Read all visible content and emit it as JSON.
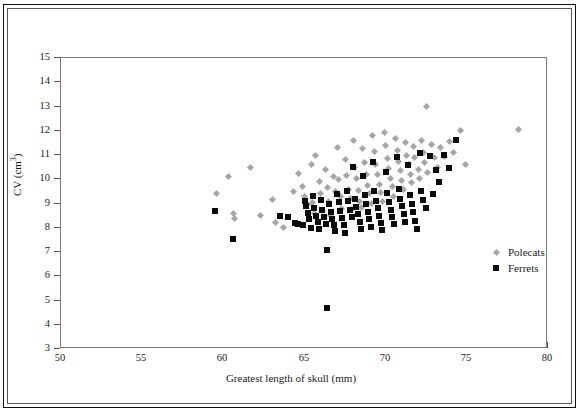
{
  "chart_data": {
    "type": "scatter",
    "title": "",
    "xlabel": "Greatest length of skull (mm)",
    "ylabel": "CV (cm³)",
    "ylabel_base": "CV (cm",
    "ylabel_sup": "3",
    "ylabel_tail": ")",
    "xlim": [
      50,
      80
    ],
    "ylim": [
      3,
      15
    ],
    "xticks": [
      50,
      55,
      60,
      65,
      70,
      75,
      80
    ],
    "yticks": [
      3,
      4,
      5,
      6,
      7,
      8,
      9,
      10,
      11,
      12,
      13,
      14,
      15
    ],
    "grid": false,
    "legend_position": "inside-right",
    "legend": [
      {
        "name": "Polecats",
        "marker": "diamond",
        "color": "#a6a6a6"
      },
      {
        "name": "Ferrets",
        "marker": "square",
        "color": "#0b0b0b"
      }
    ],
    "series": [
      {
        "name": "Polecats",
        "marker": "diamond",
        "color": "#a6a6a6",
        "points": [
          [
            59.6,
            9.4
          ],
          [
            60.3,
            10.1
          ],
          [
            60.6,
            8.6
          ],
          [
            60.7,
            8.4
          ],
          [
            61.7,
            10.5
          ],
          [
            62.3,
            8.5
          ],
          [
            63.0,
            9.15
          ],
          [
            63.2,
            8.2
          ],
          [
            63.7,
            8.0
          ],
          [
            64.3,
            9.5
          ],
          [
            64.6,
            10.25
          ],
          [
            64.9,
            9.7
          ],
          [
            65.0,
            9.3
          ],
          [
            65.2,
            8.95
          ],
          [
            65.4,
            10.6
          ],
          [
            65.5,
            9.05
          ],
          [
            65.6,
            8.6
          ],
          [
            65.7,
            11.0
          ],
          [
            65.9,
            9.9
          ],
          [
            66.0,
            9.4
          ],
          [
            66.1,
            8.7
          ],
          [
            66.3,
            10.4
          ],
          [
            66.4,
            9.65
          ],
          [
            66.5,
            9.1
          ],
          [
            66.6,
            8.5
          ],
          [
            66.8,
            10.1
          ],
          [
            66.9,
            9.5
          ],
          [
            67.0,
            11.3
          ],
          [
            67.1,
            10.0
          ],
          [
            67.2,
            9.3
          ],
          [
            67.3,
            8.8
          ],
          [
            67.5,
            10.8
          ],
          [
            67.6,
            10.15
          ],
          [
            67.7,
            9.6
          ],
          [
            67.8,
            9.2
          ],
          [
            67.9,
            8.75
          ],
          [
            68.0,
            11.6
          ],
          [
            68.1,
            10.5
          ],
          [
            68.2,
            10.05
          ],
          [
            68.3,
            9.55
          ],
          [
            68.4,
            9.1
          ],
          [
            68.5,
            8.85
          ],
          [
            68.6,
            11.25
          ],
          [
            68.7,
            10.7
          ],
          [
            68.8,
            10.2
          ],
          [
            68.9,
            9.75
          ],
          [
            69.0,
            9.4
          ],
          [
            69.1,
            9.0
          ],
          [
            69.2,
            11.8
          ],
          [
            69.3,
            11.15
          ],
          [
            69.4,
            10.6
          ],
          [
            69.5,
            10.2
          ],
          [
            69.6,
            9.8
          ],
          [
            69.7,
            9.45
          ],
          [
            69.8,
            9.1
          ],
          [
            69.9,
            11.95
          ],
          [
            70.0,
            11.4
          ],
          [
            70.1,
            10.85
          ],
          [
            70.2,
            10.45
          ],
          [
            70.3,
            10.05
          ],
          [
            70.4,
            9.7
          ],
          [
            70.5,
            9.3
          ],
          [
            70.6,
            11.7
          ],
          [
            70.7,
            11.2
          ],
          [
            70.8,
            10.75
          ],
          [
            70.9,
            10.35
          ],
          [
            71.0,
            9.95
          ],
          [
            71.1,
            9.6
          ],
          [
            71.2,
            11.5
          ],
          [
            71.3,
            11.0
          ],
          [
            71.4,
            10.6
          ],
          [
            71.5,
            10.2
          ],
          [
            71.6,
            9.85
          ],
          [
            71.7,
            11.35
          ],
          [
            71.8,
            10.9
          ],
          [
            72.0,
            10.4
          ],
          [
            72.1,
            10.05
          ],
          [
            72.2,
            11.6
          ],
          [
            72.3,
            11.1
          ],
          [
            72.4,
            10.7
          ],
          [
            72.5,
            13.0
          ],
          [
            72.6,
            10.3
          ],
          [
            72.8,
            11.45
          ],
          [
            73.0,
            10.9
          ],
          [
            73.2,
            10.5
          ],
          [
            73.4,
            11.3
          ],
          [
            73.6,
            10.95
          ],
          [
            73.9,
            11.55
          ],
          [
            74.2,
            11.1
          ],
          [
            74.6,
            12.0
          ],
          [
            74.9,
            10.6
          ],
          [
            78.2,
            12.05
          ]
        ]
      },
      {
        "name": "Ferrets",
        "marker": "square",
        "color": "#0b0b0b",
        "points": [
          [
            59.5,
            8.7
          ],
          [
            60.6,
            7.55
          ],
          [
            63.5,
            8.5
          ],
          [
            64.0,
            8.45
          ],
          [
            64.4,
            8.2
          ],
          [
            64.6,
            8.15
          ],
          [
            64.9,
            8.1
          ],
          [
            65.0,
            9.1
          ],
          [
            65.1,
            8.9
          ],
          [
            65.2,
            8.6
          ],
          [
            65.3,
            8.35
          ],
          [
            65.4,
            8.0
          ],
          [
            65.5,
            9.3
          ],
          [
            65.6,
            8.8
          ],
          [
            65.7,
            8.5
          ],
          [
            65.8,
            8.25
          ],
          [
            65.9,
            7.95
          ],
          [
            66.0,
            9.15
          ],
          [
            66.1,
            8.75
          ],
          [
            66.2,
            8.45
          ],
          [
            66.3,
            8.15
          ],
          [
            66.4,
            7.1
          ],
          [
            66.4,
            4.7
          ],
          [
            66.5,
            9.0
          ],
          [
            66.6,
            8.65
          ],
          [
            66.7,
            8.35
          ],
          [
            66.8,
            8.1
          ],
          [
            66.9,
            7.85
          ],
          [
            67.0,
            9.4
          ],
          [
            67.1,
            9.05
          ],
          [
            67.2,
            8.7
          ],
          [
            67.3,
            8.4
          ],
          [
            67.4,
            8.1
          ],
          [
            67.5,
            7.8
          ],
          [
            67.6,
            9.5
          ],
          [
            67.7,
            9.1
          ],
          [
            67.8,
            8.75
          ],
          [
            67.9,
            8.45
          ],
          [
            68.0,
            10.5
          ],
          [
            68.1,
            9.2
          ],
          [
            68.2,
            8.85
          ],
          [
            68.3,
            8.55
          ],
          [
            68.4,
            8.25
          ],
          [
            68.5,
            7.95
          ],
          [
            68.6,
            10.15
          ],
          [
            68.7,
            9.35
          ],
          [
            68.8,
            9.0
          ],
          [
            68.9,
            8.65
          ],
          [
            69.0,
            8.35
          ],
          [
            69.1,
            8.05
          ],
          [
            69.2,
            10.7
          ],
          [
            69.3,
            9.5
          ],
          [
            69.4,
            9.1
          ],
          [
            69.5,
            8.8
          ],
          [
            69.6,
            8.5
          ],
          [
            69.7,
            8.2
          ],
          [
            69.8,
            7.9
          ],
          [
            70.0,
            10.3
          ],
          [
            70.1,
            9.45
          ],
          [
            70.2,
            9.05
          ],
          [
            70.3,
            8.75
          ],
          [
            70.4,
            8.45
          ],
          [
            70.5,
            8.15
          ],
          [
            70.7,
            10.9
          ],
          [
            70.8,
            9.6
          ],
          [
            70.9,
            9.2
          ],
          [
            71.0,
            8.9
          ],
          [
            71.1,
            8.55
          ],
          [
            71.2,
            8.25
          ],
          [
            71.4,
            10.6
          ],
          [
            71.5,
            9.35
          ],
          [
            71.6,
            9.0
          ],
          [
            71.7,
            8.65
          ],
          [
            71.8,
            8.3
          ],
          [
            71.9,
            7.95
          ],
          [
            72.1,
            11.1
          ],
          [
            72.2,
            9.5
          ],
          [
            72.3,
            9.15
          ],
          [
            72.5,
            8.8
          ],
          [
            72.7,
            10.95
          ],
          [
            72.9,
            9.4
          ],
          [
            73.1,
            10.4
          ],
          [
            73.3,
            9.9
          ],
          [
            73.6,
            11.0
          ],
          [
            73.9,
            10.45
          ],
          [
            74.3,
            11.6
          ]
        ]
      }
    ]
  }
}
